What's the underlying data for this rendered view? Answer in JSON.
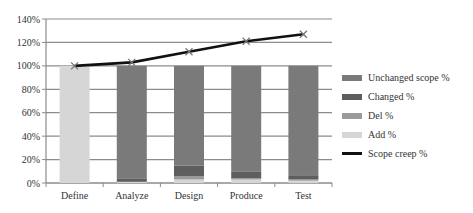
{
  "chart_data": {
    "type": "bar",
    "subtype": "stacked-bar-with-line",
    "title": "",
    "xlabel": "",
    "ylabel": "",
    "ylim": [
      0,
      140
    ],
    "yticks": [
      "0%",
      "20%",
      "40%",
      "60%",
      "80%",
      "100%",
      "120%",
      "140%"
    ],
    "grid": true,
    "legend_position": "right",
    "categories": [
      "Define",
      "Analyze",
      "Design",
      "Produce",
      "Test"
    ],
    "series": [
      {
        "name": "Unchanged scope %",
        "type": "bar",
        "color": "#7a7a7a",
        "values": [
          0,
          96,
          85,
          90,
          94
        ]
      },
      {
        "name": "Changed %",
        "type": "bar",
        "color": "#5e5e5e",
        "values": [
          0,
          3,
          9,
          6,
          3
        ]
      },
      {
        "name": "Del %",
        "type": "bar",
        "color": "#9a9a9a",
        "values": [
          0,
          0,
          3,
          1,
          1
        ]
      },
      {
        "name": "Add %",
        "type": "bar",
        "color": "#d6d6d6",
        "values": [
          100,
          1,
          3,
          3,
          2
        ]
      },
      {
        "name": "Scope creep %",
        "type": "line",
        "color": "#111111",
        "marker": "x",
        "values": [
          100,
          103,
          112,
          121,
          127
        ]
      }
    ]
  }
}
